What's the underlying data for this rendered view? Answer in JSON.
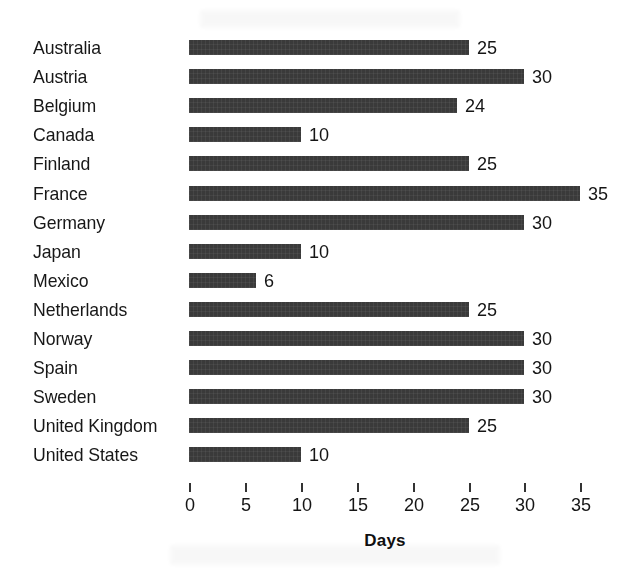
{
  "chart_data": {
    "type": "bar",
    "orientation": "horizontal",
    "title": "",
    "subtitle": "",
    "xlabel": "Days",
    "ylabel": "",
    "xlim": [
      0,
      35
    ],
    "xticks": [
      0,
      5,
      10,
      15,
      20,
      25,
      30,
      35
    ],
    "xtick_labels": [
      "0",
      "5",
      "10",
      "15",
      "20",
      "25",
      "30",
      "35"
    ],
    "grid": false,
    "legend": false,
    "bar_color": "#3a3a3a",
    "background_color": "#ffffff",
    "categories": [
      "Australia",
      "Austria",
      "Belgium",
      "Canada",
      "Finland",
      "France",
      "Germany",
      "Japan",
      "Mexico",
      "Netherlands",
      "Norway",
      "Spain",
      "Sweden",
      "United Kingdom",
      "United States"
    ],
    "values": [
      25,
      30,
      24,
      10,
      25,
      35,
      30,
      10,
      6,
      25,
      30,
      30,
      30,
      25,
      10
    ],
    "value_labels": [
      "25",
      "30",
      "24",
      "10",
      "25",
      "35",
      "30",
      "10",
      "6",
      "25",
      "30",
      "30",
      "30",
      "25",
      "10"
    ]
  }
}
